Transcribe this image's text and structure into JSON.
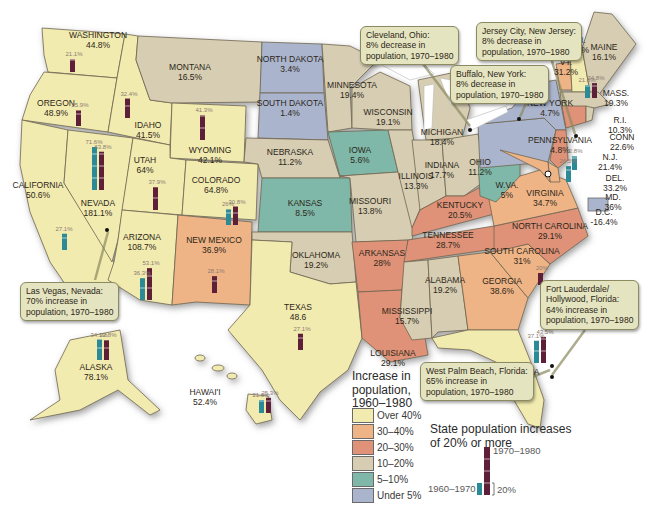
{
  "title": "Increase in population, 1960–1980",
  "legend": {
    "title_lines": [
      "Increase in",
      "population,",
      "1960–1980"
    ],
    "items": [
      {
        "label": "Over 40%",
        "color": "#f2ebb0"
      },
      {
        "label": "30–40%",
        "color": "#efb486"
      },
      {
        "label": "20–30%",
        "color": "#df9278"
      },
      {
        "label": "10–20%",
        "color": "#d6cdb2"
      },
      {
        "label": "5–10%",
        "color": "#7fb8a8"
      },
      {
        "label": "Under 5%",
        "color": "#aab4cc"
      }
    ]
  },
  "bar_legend": {
    "title_lines": [
      "State population increases",
      "of 20% or more"
    ],
    "label_1970_1980": "1970–1980",
    "label_1960_1970": "1960–1970",
    "scale_label": "20%",
    "color_1960_1970": "#2b8a96",
    "color_1970_1980": "#5e1f38"
  },
  "states": [
    {
      "id": "washington",
      "name": "Washington",
      "value": "44.8%",
      "category": "Over 40%"
    },
    {
      "id": "oregon",
      "name": "Oregon",
      "value": "48.9%",
      "category": "Over 40%"
    },
    {
      "id": "california",
      "name": "California",
      "value": "50.6%",
      "category": "Over 40%"
    },
    {
      "id": "nevada",
      "name": "Nevada",
      "value": "181.1%",
      "category": "Over 40%"
    },
    {
      "id": "idaho",
      "name": "Idaho",
      "value": "41.5%",
      "category": "Over 40%"
    },
    {
      "id": "montana",
      "name": "Montana",
      "value": "16.5%",
      "category": "10–20%"
    },
    {
      "id": "wyoming",
      "name": "Wyoming",
      "value": "42.1%",
      "category": "Over 40%"
    },
    {
      "id": "utah",
      "name": "Utah",
      "value": "64%",
      "category": "Over 40%"
    },
    {
      "id": "colorado",
      "name": "Colorado",
      "value": "64.8%",
      "category": "Over 40%"
    },
    {
      "id": "arizona",
      "name": "Arizona",
      "value": "108.7%",
      "category": "Over 40%"
    },
    {
      "id": "new-mexico",
      "name": "New Mexico",
      "value": "36.9%",
      "category": "30–40%"
    },
    {
      "id": "north-dakota",
      "name": "North Dakota",
      "value": "3.4%",
      "category": "Under 5%"
    },
    {
      "id": "south-dakota",
      "name": "South Dakota",
      "value": "1.4%",
      "category": "Under 5%"
    },
    {
      "id": "nebraska",
      "name": "Nebraska",
      "value": "11.2%",
      "category": "10–20%"
    },
    {
      "id": "kansas",
      "name": "Kansas",
      "value": "8.5%",
      "category": "5–10%"
    },
    {
      "id": "oklahoma",
      "name": "Oklahoma",
      "value": "19.2%",
      "category": "10–20%"
    },
    {
      "id": "texas",
      "name": "Texas",
      "value": "48.6",
      "category": "Over 40%"
    },
    {
      "id": "minnesota",
      "name": "Minnesota",
      "value": "19.4%",
      "category": "10–20%"
    },
    {
      "id": "iowa",
      "name": "Iowa",
      "value": "5.6%",
      "category": "5–10%"
    },
    {
      "id": "missouri",
      "name": "Missouri",
      "value": "13.8%",
      "category": "10–20%"
    },
    {
      "id": "arkansas",
      "name": "Arkansas",
      "value": "28%",
      "category": "20–30%"
    },
    {
      "id": "louisiana",
      "name": "Louisiana",
      "value": "29.1%",
      "category": "20–30%"
    },
    {
      "id": "wisconsin",
      "name": "Wisconsin",
      "value": "19.1%",
      "category": "10–20%"
    },
    {
      "id": "illinois",
      "name": "Illinois",
      "value": "13.3%",
      "category": "10–20%"
    },
    {
      "id": "michigan",
      "name": "Michigan",
      "value": "18.4%",
      "category": "10–20%"
    },
    {
      "id": "indiana",
      "name": "Indiana",
      "value": "17.7%",
      "category": "10–20%"
    },
    {
      "id": "ohio",
      "name": "Ohio",
      "value": "11.2%",
      "category": "10–20%"
    },
    {
      "id": "kentucky",
      "name": "Kentucky",
      "value": "20.5%",
      "category": "20–30%"
    },
    {
      "id": "tennessee",
      "name": "Tennessee",
      "value": "28.7%",
      "category": "20–30%"
    },
    {
      "id": "mississippi",
      "name": "Mississippi",
      "value": "15.7%",
      "category": "10–20%"
    },
    {
      "id": "alabama",
      "name": "Alabama",
      "value": "19.2%",
      "category": "10–20%"
    },
    {
      "id": "georgia",
      "name": "Georgia",
      "value": "38.6%",
      "category": "30–40%"
    },
    {
      "id": "florida",
      "name": "Florida",
      "value": "96.7%",
      "category": "Over 40%"
    },
    {
      "id": "south-carolina",
      "name": "South Carolina",
      "value": "31%",
      "category": "30–40%"
    },
    {
      "id": "north-carolina",
      "name": "North Carolina",
      "value": "29.1%",
      "category": "20–30%"
    },
    {
      "id": "virginia",
      "name": "Virginia",
      "value": "34.7%",
      "category": "30–40%"
    },
    {
      "id": "west-virginia",
      "name": "W.Va.",
      "value": "5%",
      "category": "5–10%"
    },
    {
      "id": "pennsylvania",
      "name": "Pennsylvania",
      "value": "4.8%",
      "category": "Under 5%"
    },
    {
      "id": "new-york",
      "name": "New York",
      "value": "4.7%",
      "category": "Under 5%"
    },
    {
      "id": "maine",
      "name": "Maine",
      "value": "16.1%",
      "category": "10–20%"
    },
    {
      "id": "new-hampshire",
      "name": "N.H.",
      "value": "51.8%",
      "category": "Over 40%"
    },
    {
      "id": "vermont",
      "name": "Vt.",
      "value": "31.2%",
      "category": "30–40%"
    },
    {
      "id": "massachusetts",
      "name": "Mass.",
      "value": "19.3%",
      "category": "10–20%"
    },
    {
      "id": "rhode-island",
      "name": "R.I.",
      "value": "10.3%",
      "category": "10–20%"
    },
    {
      "id": "connecticut",
      "name": "Conn",
      "value": "22.6%",
      "category": "20–30%"
    },
    {
      "id": "new-jersey",
      "name": "N.J.",
      "value": "21.4%",
      "category": "20–30%"
    },
    {
      "id": "delaware",
      "name": "Del.",
      "value": "33.2%",
      "category": "30–40%"
    },
    {
      "id": "maryland",
      "name": "Md.",
      "value": "36%",
      "category": "30–40%"
    },
    {
      "id": "dc",
      "name": "D.C.",
      "value": "-16.4%",
      "category": "Under 5%"
    },
    {
      "id": "alaska",
      "name": "Alaska",
      "value": "78.1%",
      "category": "Over 40%"
    },
    {
      "id": "hawaii",
      "name": "Hawai'i",
      "value": "52.4%",
      "category": "Over 40%"
    }
  ],
  "state_bars": [
    {
      "state": "Washington",
      "p1960_1970": null,
      "p1970_1980": "21.1%"
    },
    {
      "state": "Oregon",
      "p1960_1970": null,
      "p1970_1980": "25.9%"
    },
    {
      "state": "Idaho",
      "p1960_1970": null,
      "p1970_1980": "32.4%"
    },
    {
      "state": "Wyoming",
      "p1960_1970": null,
      "p1970_1980": "41.3%"
    },
    {
      "state": "Nevada",
      "p1960_1970": "71.6%",
      "p1970_1980": "63.8%"
    },
    {
      "state": "Utah",
      "p1960_1970": null,
      "p1970_1980": "37.9%"
    },
    {
      "state": "California",
      "p1960_1970": "27.1%",
      "p1970_1980": null
    },
    {
      "state": "Colorado",
      "p1960_1970": "26%",
      "p1970_1980": "30.8%"
    },
    {
      "state": "Arizona",
      "p1960_1970": "36.3%",
      "p1970_1980": "53.1%"
    },
    {
      "state": "New Mexico",
      "p1960_1970": null,
      "p1970_1980": "28.1%"
    },
    {
      "state": "Texas",
      "p1960_1970": null,
      "p1970_1980": "27.1%"
    },
    {
      "state": "Alaska",
      "p1960_1970": "34.1%",
      "p1970_1980": "32.8%"
    },
    {
      "state": "Hawaii",
      "p1960_1970": "21.6%",
      "p1970_1980": "25.3%"
    },
    {
      "state": "Florida",
      "p1960_1970": "37.1%",
      "p1970_1980": "43.5%"
    },
    {
      "state": "South Carolina",
      "p1960_1970": null,
      "p1970_1980": "20%"
    },
    {
      "state": "New Hampshire",
      "p1960_1970": "21.6%",
      "p1970_1980": "24.8%"
    },
    {
      "state": "Maryland",
      "p1960_1970": "26.5%",
      "p1970_1980": null
    },
    {
      "state": "Delaware",
      "p1960_1970": "22.8%",
      "p1970_1980": null
    }
  ],
  "callouts": [
    {
      "id": "cleveland",
      "lines": [
        "Cleveland, Ohio:",
        "8% decrease in",
        "population, 1970–1980"
      ]
    },
    {
      "id": "buffalo",
      "lines": [
        "Buffalo, New York:",
        "8% decrease in",
        "population, 1970–1980"
      ]
    },
    {
      "id": "jersey-city",
      "lines": [
        "Jersey City, New Jersey:",
        "8% decrease in",
        "population, 1970–1980"
      ]
    },
    {
      "id": "las-vegas",
      "lines": [
        "Las Vegas, Nevada:",
        "70% increase in",
        "population, 1970–1980"
      ]
    },
    {
      "id": "west-palm-beach",
      "lines": [
        "West Palm Beach, Florida:",
        "65% increase in",
        "population, 1970–1980"
      ]
    },
    {
      "id": "fort-lauderdale",
      "lines": [
        "Fort Lauderdale/",
        "Hollywood, Florida:",
        "64% increase in",
        "population, 1970–1980"
      ]
    }
  ]
}
